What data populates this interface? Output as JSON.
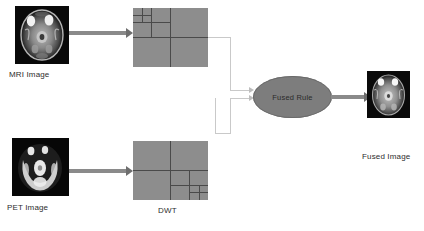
{
  "diagram": {
    "nodes": {
      "mri_image": {
        "label": "MRI Image",
        "type": "image-thumbnail",
        "modality": "MRI"
      },
      "pet_image": {
        "label": "PET Image",
        "type": "image-thumbnail",
        "modality": "PET"
      },
      "dwt_top": {
        "label": "",
        "type": "dwt-decomposition",
        "levels": 3,
        "corner": "top-left"
      },
      "dwt_bottom": {
        "label": "",
        "type": "dwt-decomposition",
        "levels": 3,
        "corner": "bottom-right"
      },
      "dwt_caption": {
        "label": "DWT"
      },
      "fused_rule": {
        "label": "Fused Rule",
        "type": "process-ellipse"
      },
      "fused_image": {
        "label": "Fused Image",
        "type": "image-thumbnail",
        "modality": "Fused"
      }
    },
    "edges": [
      {
        "from": "mri_image",
        "to": "dwt_top",
        "style": "thick-arrow"
      },
      {
        "from": "pet_image",
        "to": "dwt_bottom",
        "style": "thick-arrow"
      },
      {
        "from": "dwt_top",
        "to": "fused_rule",
        "style": "thin-elbow-arrow"
      },
      {
        "from": "dwt_bottom",
        "to": "fused_rule",
        "style": "thin-elbow-arrow"
      },
      {
        "from": "fused_rule",
        "to": "fused_image",
        "style": "thick-arrow"
      }
    ],
    "colors": {
      "background": "#ffffff",
      "dwt_fill": "#8d8d8d",
      "dwt_grid": "#4a4a4a",
      "ellipse_fill": "#7d7d7d",
      "thick_arrow": "#8a8a8a",
      "thin_connector": "#c9c9c9",
      "caption_text": "#2d2d2d",
      "thumbnail_bg": "#0a0a0a"
    }
  }
}
